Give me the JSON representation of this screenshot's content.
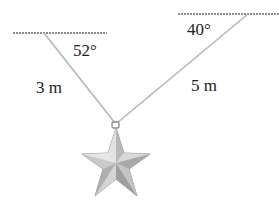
{
  "diagram": {
    "type": "statics-free-body",
    "left_support": {
      "angle_label": "52°",
      "rope_length_label": "3 m"
    },
    "right_support": {
      "angle_label": "40°",
      "rope_length_label": "5 m"
    },
    "object": "star-ornament",
    "colors": {
      "rope": "#b4b4b4",
      "ceiling": "#8c8c8c",
      "star_light": "#d9d9d9",
      "star_mid": "#bdbdbd",
      "star_dark": "#9e9e9e",
      "text": "#222222"
    }
  }
}
